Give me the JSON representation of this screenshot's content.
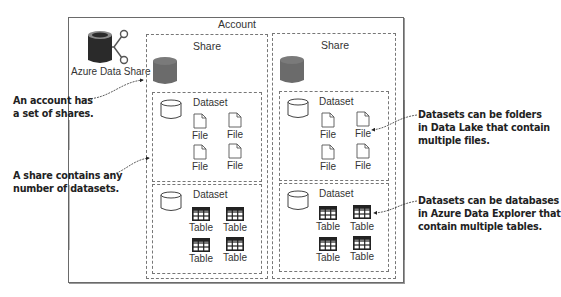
{
  "account": {
    "title": "Account",
    "service_label": "Azure Data Share"
  },
  "shares": [
    {
      "title": "Share",
      "datasets": [
        {
          "title": "Dataset",
          "item_type": "file",
          "items": [
            "File",
            "File",
            "File",
            "File"
          ]
        },
        {
          "title": "Dataset",
          "item_type": "table",
          "items": [
            "Table",
            "Table",
            "Table",
            "Table"
          ]
        }
      ]
    },
    {
      "title": "Share",
      "datasets": [
        {
          "title": "Dataset",
          "item_type": "file",
          "items": [
            "File",
            "File",
            "File",
            "File"
          ]
        },
        {
          "title": "Dataset",
          "item_type": "table",
          "items": [
            "Table",
            "Table",
            "Table",
            "Table"
          ]
        }
      ]
    }
  ],
  "callouts": {
    "left_1": [
      "An account has",
      "a set of shares."
    ],
    "left_2": [
      "A share contains any",
      "number of datasets."
    ],
    "right_1": [
      "Datasets can be folders",
      "in Data Lake that contain",
      "multiple files."
    ],
    "right_2": [
      "Datasets can be databases",
      "in Azure Data Explorer that",
      "contain multiple tables."
    ]
  },
  "colors": {
    "share_db": "#6b6b6b",
    "service_db": "#2a2a2a",
    "service_db_top": "#8a8a8a",
    "border": "#6a6a6a",
    "dashed": "#777777",
    "callout_text": "#222222"
  },
  "icons": {
    "service": "azure-data-share-icon",
    "share": "database-filled-icon",
    "dataset": "database-outline-icon",
    "file": "file-icon",
    "table": "table-grid-icon"
  }
}
